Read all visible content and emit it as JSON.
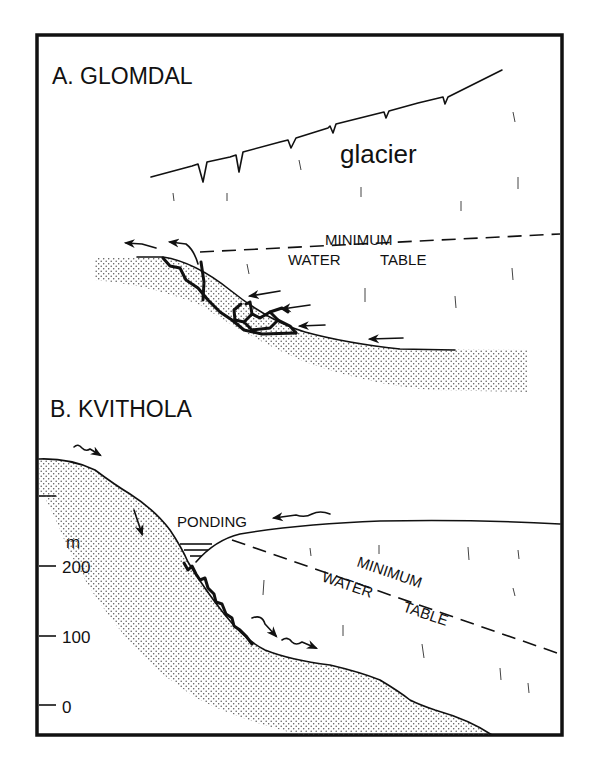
{
  "figure": {
    "panel_a": {
      "title": "A. GLOMDAL",
      "glacier_label": "glacier",
      "water_table_line1": "MINIMUM",
      "water_table_line2": "WATER",
      "water_table_line3": "TABLE"
    },
    "panel_b": {
      "title": "B. KVITHOLA",
      "ponding_label": "PONDING",
      "water_table_line1": "MINIMUM",
      "water_table_line2": "WATER",
      "water_table_line3": "TABLE",
      "scale": {
        "unit": "m",
        "ticks": [
          "200",
          "100",
          "0"
        ]
      }
    },
    "colors": {
      "ink": "#111111",
      "background": "#ffffff",
      "stipple": "#555555"
    }
  }
}
